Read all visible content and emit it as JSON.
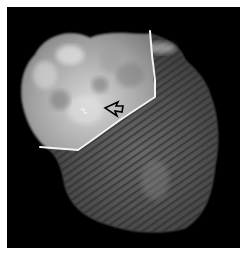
{
  "image": {
    "description": "Grayscale radiographic/microscopy image of an irregular specimen on black background with white boundary line and arrow marker",
    "background_color": "#000000",
    "border_color": "#ffffff",
    "annotation_line_color": "#f2f2f2",
    "arrow_color": "#000000",
    "annotations": {
      "boundary_line": "white polyline separating bright upper-left region from striated lower-right region",
      "arrow": "open arrowhead pointing left",
      "marker": "small S-shaped bright mark"
    }
  }
}
